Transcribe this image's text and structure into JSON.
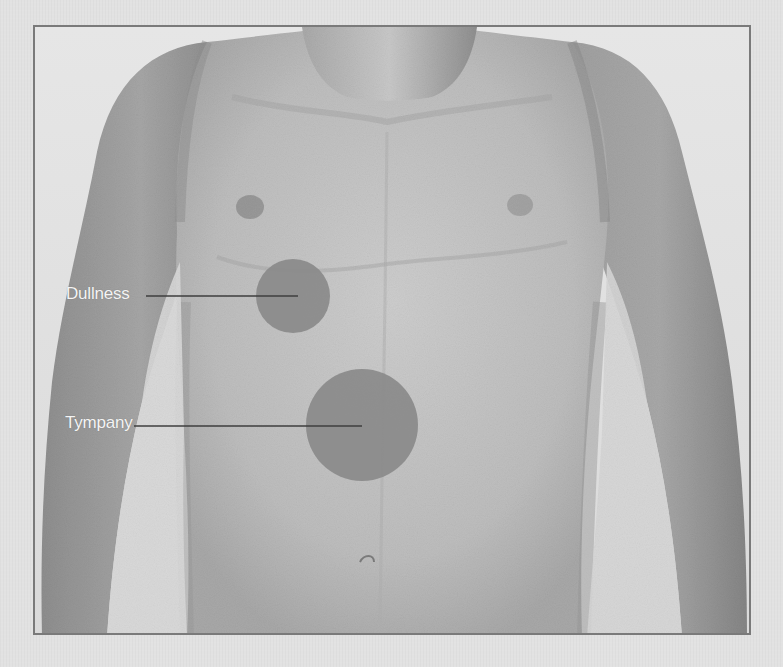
{
  "figure": {
    "frame_color": "#7a7a7a",
    "background_color": "#e2e2e2",
    "regions": [
      {
        "id": "dullness",
        "label": "Dullness",
        "description": "Liver area, right lower chest",
        "circle": {
          "cx": 291,
          "cy": 294,
          "r": 37
        },
        "fill": "#8a8a8a",
        "label_pos": {
          "x": 66,
          "y": 284
        },
        "line": {
          "x1": 144,
          "y1": 294,
          "x2": 296,
          "y2": 294
        }
      },
      {
        "id": "tympany",
        "label": "Tympany",
        "description": "Gastric air bubble area, left upper abdomen",
        "circle": {
          "cx": 360,
          "cy": 423,
          "r": 56
        },
        "fill": "#8a8a8a",
        "label_pos": {
          "x": 65,
          "y": 413
        },
        "line": {
          "x1": 132,
          "y1": 424,
          "x2": 360,
          "y2": 424
        }
      }
    ]
  }
}
